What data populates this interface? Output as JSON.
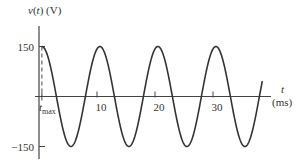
{
  "chart_data": {
    "type": "line",
    "title": "",
    "ylabel": "v(t) (V)",
    "ylabel_parts": {
      "var": "v",
      "open": "(",
      "arg": "t",
      "close": ")",
      "unit": " (V)"
    },
    "xlabel_var": "t",
    "xlabel_unit": "(ms)",
    "xlim": [
      0,
      39
    ],
    "ylim": [
      -150,
      150
    ],
    "amplitude": 150,
    "period_ms": 10,
    "t_max_ms": 0.5,
    "t_end_ms": 38.5,
    "x_ticks": [
      {
        "value": 10,
        "label": "10"
      },
      {
        "value": 20,
        "label": "20"
      },
      {
        "value": 30,
        "label": "30"
      }
    ],
    "y_ticks": [
      {
        "value": 150,
        "label": "150"
      },
      {
        "value": -150,
        "label": "−150"
      }
    ],
    "annotations": [
      {
        "text": "t",
        "subscript": "max",
        "at_x": 0.5,
        "style": "dashed vertical line from peak to axis"
      }
    ],
    "series": [
      {
        "name": "v(t)",
        "function": "150*cos(2*pi*(t - 0.5)/10)",
        "color": "#333333"
      }
    ],
    "grid": false,
    "legend": "none"
  }
}
